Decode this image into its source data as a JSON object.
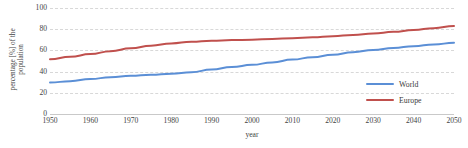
{
  "chart_data": {
    "type": "line",
    "title": "",
    "xlabel": "year",
    "ylabel_line1": "percentage [%] of the",
    "ylabel_line2": "population",
    "x": [
      1950,
      1955,
      1960,
      1965,
      1970,
      1975,
      1980,
      1985,
      1990,
      1995,
      2000,
      2005,
      2010,
      2015,
      2020,
      2025,
      2030,
      2035,
      2040,
      2045,
      2050
    ],
    "xlim": [
      1950,
      2050
    ],
    "ylim": [
      0,
      100
    ],
    "xticks": [
      "1950",
      "1960",
      "1970",
      "1980",
      "1990",
      "2000",
      "2010",
      "2020",
      "2030",
      "2040",
      "2050"
    ],
    "yticks": [
      "0",
      "20",
      "40",
      "60",
      "80",
      "100"
    ],
    "grid": "horizontal-dashed",
    "legend_position": "inside-right",
    "series": [
      {
        "name": "World",
        "color": "#5B8FD6",
        "values": [
          29.6,
          31.0,
          33.0,
          34.7,
          36.0,
          37.0,
          38.0,
          39.3,
          42.0,
          44.3,
          46.4,
          48.7,
          51.3,
          53.6,
          55.9,
          58.3,
          60.4,
          62.3,
          64.0,
          65.6,
          67.2
        ]
      },
      {
        "name": "Europe",
        "color": "#C0504D",
        "values": [
          51.7,
          54.0,
          56.5,
          59.3,
          62.0,
          64.5,
          66.6,
          68.2,
          69.2,
          69.7,
          70.1,
          70.8,
          71.5,
          72.4,
          73.4,
          74.6,
          76.0,
          77.5,
          79.2,
          81.0,
          83.0
        ]
      }
    ]
  },
  "legend": {
    "items": [
      {
        "label": "World",
        "color": "#5B8FD6"
      },
      {
        "label": "Europe",
        "color": "#C0504D"
      }
    ]
  }
}
